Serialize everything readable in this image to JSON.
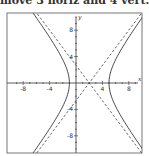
{
  "caption": "move 3 horiz and 4 vert.",
  "chart_data": {
    "type": "line",
    "title": "",
    "xlabel": "x",
    "ylabel": "y",
    "xlim": [
      -10,
      10
    ],
    "ylim": [
      -10.5,
      10.5
    ],
    "x_ticks": [
      -8,
      -4,
      4,
      8
    ],
    "y_ticks": [
      8,
      4,
      -4,
      -8
    ],
    "grid": false,
    "series": [
      {
        "name": "hyperbola",
        "style": "solid",
        "equation": "(x-2)^2/9 - y^2/16 = 1",
        "center": [
          2,
          0
        ],
        "a": 3,
        "b": 4,
        "vertices": [
          [
            -1,
            0
          ],
          [
            5,
            0
          ]
        ]
      },
      {
        "name": "asymptote 1",
        "style": "dashed",
        "equation": "y = 4/3 (x - 2)"
      },
      {
        "name": "asymptote 2",
        "style": "dashed",
        "equation": "y = -4/3 (x - 2)"
      }
    ]
  }
}
